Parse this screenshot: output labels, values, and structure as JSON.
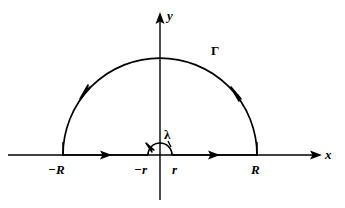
{
  "figure": {
    "background_color": "#ffffff",
    "stroke_color": "#000000",
    "axes": {
      "x_label": "x",
      "y_label": "y",
      "x_axis_start": 8,
      "x_axis_end": 320,
      "y_axis_top": 14,
      "y_axis_bottom": 200,
      "origin_x": 160,
      "origin_y": 155
    },
    "labels": {
      "neg_R": "−R",
      "neg_r": "−r",
      "pos_r": "r",
      "pos_R": "R",
      "big_arc": "Γ",
      "small_arc": "λ"
    },
    "geometry": {
      "big_radius": 97,
      "small_radius": 12,
      "big_arc_left_x": 63,
      "big_arc_right_x": 257,
      "small_arc_left_x": 148,
      "small_arc_right_x": 172,
      "big_arc_apex_y": 58,
      "small_arc_apex_y": 143
    },
    "orientation": "counterclockwise",
    "arrow_markers": [
      {
        "name": "left-segment-arrow",
        "direction": "right",
        "x": 105,
        "y": 155
      },
      {
        "name": "right-segment-arrow",
        "direction": "right",
        "x": 213,
        "y": 155
      },
      {
        "name": "big-arc-left-arrow",
        "direction": "down-left",
        "x": 85,
        "y": 93
      },
      {
        "name": "big-arc-right-arrow",
        "direction": "up-left",
        "x": 235,
        "y": 93
      },
      {
        "name": "small-arc-left-arrow",
        "direction": "up-left",
        "x": 149,
        "y": 148
      },
      {
        "name": "x-axis-arrow",
        "direction": "right",
        "x": 320,
        "y": 155
      },
      {
        "name": "y-axis-arrow",
        "direction": "up",
        "x": 160,
        "y": 14
      }
    ]
  }
}
